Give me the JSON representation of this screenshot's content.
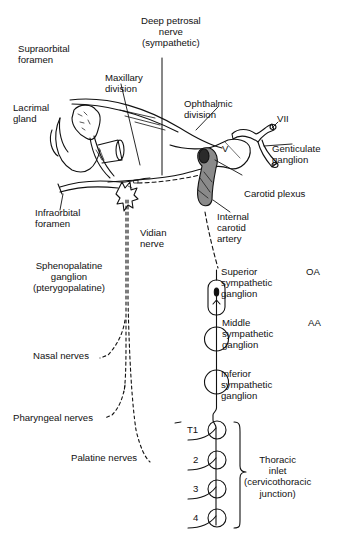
{
  "diagram": {
    "type": "anatomical-nerve-pathway",
    "colors": {
      "ink": "#111111",
      "background": "#ffffff",
      "shade": "#8a8a8a"
    },
    "labels": {
      "deep_petrosal": "Deep petrosal\nnerve\n(sympathetic)",
      "supraorbital": "Supraorbital\nforamen",
      "maxillary": "Maxillary\ndivision",
      "lacrimal": "Lacrimal\ngland",
      "ophthalmic": "Ophthalmic\ndivision",
      "vii": "VII",
      "v": "V",
      "geniculate": "Genticulate\nganglion",
      "carotid_plexus": "Carotid plexus",
      "infraorbital": "Infraorbital\nforamen",
      "vidian": "Vidian\nnerve",
      "internal_carotid": "Internal\ncarotid\nartery",
      "sphenopalatine": "Sphenopalatine\nganglion\n(pterygopalatine)",
      "superior_ganglion": "Superior\nsympathetic\nganglion",
      "oa": "OA",
      "middle_ganglion": "Middle\nsympathetic\nganglion",
      "aa": "AA",
      "inferior_ganglion": "Inferior\nsympathetic\nganglion",
      "nasal": "Nasal nerves",
      "pharyngeal": "Pharyngeal nerves",
      "palatine": "Palatine nerves",
      "t1": "T1",
      "t2": "2",
      "t3": "3",
      "t4": "4",
      "thoracic_inlet": "Thoracic\ninlet\n(cervicothoracic\njunction)"
    }
  }
}
